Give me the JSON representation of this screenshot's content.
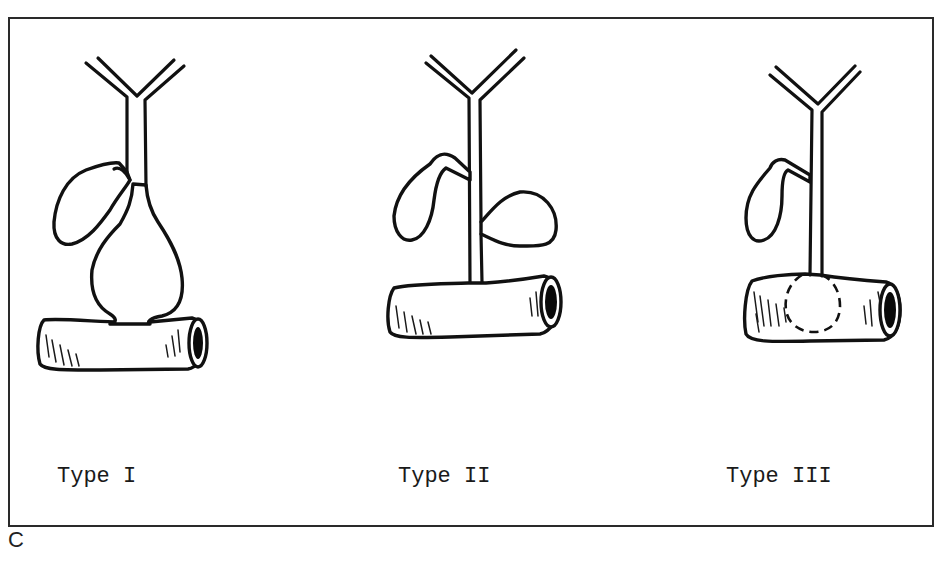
{
  "figure": {
    "panel_letter": "C",
    "colors": {
      "line": "#111111",
      "background": "#ffffff",
      "frame": "#2a2a2a"
    },
    "panels": [
      {
        "label": "Type I",
        "description": "fusiform dilatation of common bile duct above duodenum",
        "elements": [
          "hepatic-duct-bifurcation",
          "gallbladder",
          "cystic-dilatation",
          "duodenum"
        ]
      },
      {
        "label": "Type II",
        "description": "diverticulum of the common bile duct",
        "elements": [
          "hepatic-duct-bifurcation",
          "gallbladder",
          "common-bile-duct",
          "diverticulum",
          "duodenum"
        ]
      },
      {
        "label": "Type III",
        "description": "choledochocele within duodenal wall (dashed outline)",
        "elements": [
          "hepatic-duct-bifurcation",
          "gallbladder",
          "common-bile-duct",
          "choledochocele",
          "duodenum"
        ]
      }
    ]
  }
}
